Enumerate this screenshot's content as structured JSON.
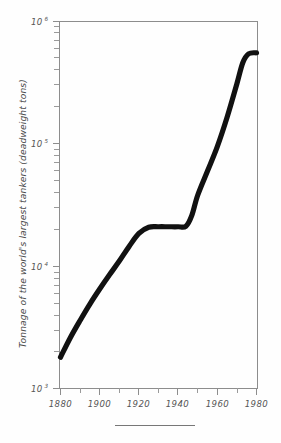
{
  "chart_data": {
    "type": "line",
    "title": "",
    "subtitle": "",
    "xlabel": "",
    "ylabel": "Tonnage of the world's largest tankers (deadweight tons)",
    "xlim": [
      1880,
      1980
    ],
    "ylim": [
      1000,
      1000000
    ],
    "yscale": "log",
    "xscale": "linear",
    "grid": false,
    "legend": null,
    "x_ticks_major": [
      1880,
      1900,
      1920,
      1940,
      1960,
      1980
    ],
    "x_ticks_major_labels": [
      "1880",
      "1900",
      "1920",
      "1940",
      "1960",
      "1980"
    ],
    "x_ticks_minor": [
      1890,
      1910,
      1930,
      1950,
      1970
    ],
    "y_ticks_major": [
      1000,
      10000,
      100000,
      1000000
    ],
    "y_ticks_major_labels": [
      "10",
      "10",
      "10",
      "10"
    ],
    "y_ticks_major_exponents": [
      "3",
      "4",
      "5",
      "6"
    ],
    "y_ticks_minor": [
      2000,
      3000,
      4000,
      5000,
      6000,
      7000,
      8000,
      9000,
      20000,
      30000,
      40000,
      50000,
      60000,
      70000,
      80000,
      90000,
      200000,
      300000,
      400000,
      500000,
      600000,
      700000,
      800000,
      900000
    ],
    "series": [
      {
        "name": "Largest tanker tonnage",
        "color": "#111111",
        "x": [
          1880,
          1885,
          1890,
          1895,
          1900,
          1905,
          1910,
          1915,
          1920,
          1925,
          1930,
          1935,
          1940,
          1944,
          1947,
          1950,
          1955,
          1960,
          1965,
          1970,
          1973,
          1976,
          1980
        ],
        "values": [
          1800,
          2600,
          3600,
          4900,
          6500,
          8500,
          11000,
          14500,
          18500,
          20800,
          21000,
          21000,
          21000,
          21200,
          26000,
          38000,
          60000,
          95000,
          165000,
          310000,
          460000,
          545000,
          555000
        ]
      }
    ],
    "annotations": [],
    "footer_rule": true
  }
}
